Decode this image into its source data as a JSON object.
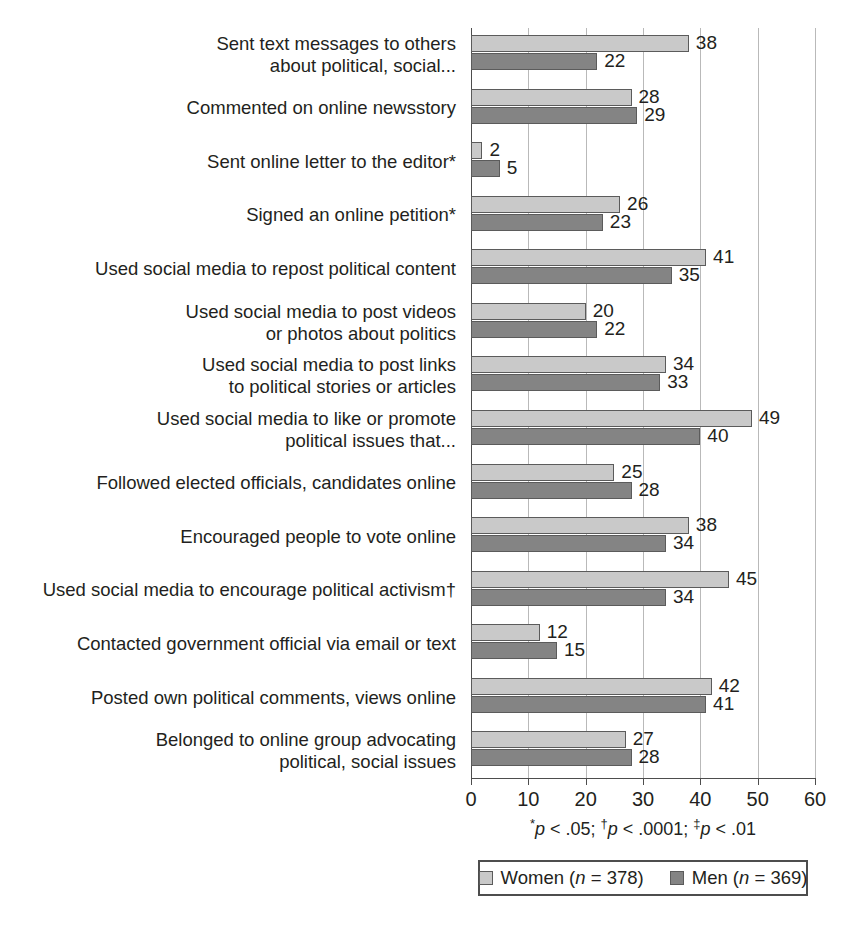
{
  "chart_data": {
    "type": "bar",
    "orientation": "horizontal",
    "title": "",
    "xlabel": "",
    "ylabel": "",
    "xlim": [
      0,
      60
    ],
    "xticks": [
      0,
      10,
      20,
      30,
      40,
      50,
      60
    ],
    "xtick_labels": [
      "0",
      "10",
      "20",
      "30",
      "40",
      "50",
      "60"
    ],
    "grid": "vertical",
    "legend_position": "bottom",
    "categories": [
      "Sent text messages to others about political, social...",
      "Commented on online newsstory",
      "Sent online letter to the editor*",
      "Signed an online petition*",
      "Used social media to repost political content",
      "Used social media to post videos or photos about politics",
      "Used social media to post links to political stories or articles",
      "Used social media to like or promote political issues that...",
      "Followed elected officials, candidates online",
      "Encouraged people to vote online",
      "Used social media to encourage political activism†",
      "Contacted government official via email or text",
      "Posted own political comments, views online",
      "Belonged to online group advocating political, social issues"
    ],
    "category_lines": [
      [
        "Sent text messages to others",
        "about political, social..."
      ],
      [
        "Commented on online newsstory"
      ],
      [
        "Sent online letter to the editor*"
      ],
      [
        "Signed an online petition*"
      ],
      [
        "Used social media to repost political content"
      ],
      [
        "Used social media to post videos",
        "or photos about politics"
      ],
      [
        "Used social media to post links",
        "to political stories or articles"
      ],
      [
        "Used social media to like or promote",
        "political issues that..."
      ],
      [
        "Followed elected officials, candidates online"
      ],
      [
        "Encouraged people to vote online"
      ],
      [
        "Used social media to encourage political activism†"
      ],
      [
        "Contacted government official via email or text"
      ],
      [
        "Posted own political comments, views online"
      ],
      [
        "Belonged to online group advocating",
        "political, social issues"
      ]
    ],
    "series": [
      {
        "name": "Women (n = 378)",
        "color": "#c9c9c9",
        "values": [
          38,
          28,
          2,
          26,
          41,
          20,
          34,
          49,
          25,
          38,
          45,
          12,
          42,
          27
        ]
      },
      {
        "name": "Men (n = 369)",
        "color": "#848484",
        "values": [
          22,
          29,
          5,
          23,
          35,
          22,
          33,
          40,
          28,
          34,
          34,
          15,
          41,
          28
        ]
      }
    ]
  },
  "legend": {
    "women_label_pre": "Women (",
    "women_label_italic": "n",
    "women_label_post": " = 378)",
    "men_label_pre": "Men (",
    "men_label_italic": "n",
    "men_label_post": " = 369)"
  },
  "footnote": {
    "full_text": "*p < .05; †p < .0001; ‡p < .01",
    "mark1": "*",
    "p1": "p",
    "val1": " < .05; ",
    "mark2": "†",
    "p2": "p",
    "val2": " < .0001; ",
    "mark3": "‡",
    "p3": "p",
    "val3": " < .01"
  },
  "colors": {
    "women_bar": "#c9c9c9",
    "men_bar": "#848484",
    "bar_border": "#5b5b5b",
    "gridline": "#b9b9b9",
    "axis": "#4d4d4d",
    "text": "#231f20"
  }
}
